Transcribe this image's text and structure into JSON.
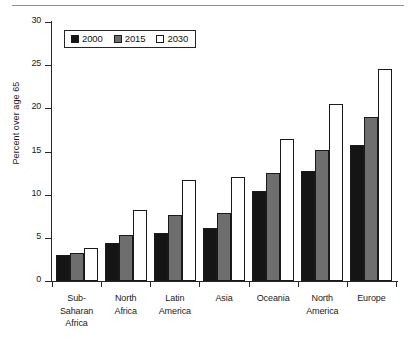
{
  "figure": {
    "top_rule": true
  },
  "chart_data": {
    "type": "bar",
    "title": "",
    "xlabel": "",
    "ylabel": "Percent over age 65",
    "ylim": [
      0,
      30
    ],
    "ytick_labels": [
      "0",
      "5",
      "10",
      "15",
      "20",
      "25",
      "30"
    ],
    "yticks": [
      0,
      5,
      10,
      15,
      20,
      25,
      30
    ],
    "grid": false,
    "legend_position": "upper left",
    "categories": [
      "Sub-\nSaharan\nAfrica",
      "North\nAfrica",
      "Latin\nAmerica",
      "Asia",
      "Oceania",
      "North\nAmerica",
      "Europe"
    ],
    "category_labels": [
      [
        "Sub-",
        "Saharan",
        "Africa"
      ],
      [
        "North",
        "Africa"
      ],
      [
        "Latin",
        "America"
      ],
      [
        "Asia"
      ],
      [
        "Oceania"
      ],
      [
        "North",
        "America"
      ],
      [
        "Europe"
      ]
    ],
    "series": [
      {
        "name": "2000",
        "color": "#151515",
        "values": [
          3.0,
          4.4,
          5.6,
          6.1,
          10.4,
          12.7,
          15.7
        ]
      },
      {
        "name": "2015",
        "color": "#6e6e6e",
        "values": [
          3.2,
          5.3,
          7.6,
          7.9,
          12.5,
          15.2,
          19.0
        ]
      },
      {
        "name": "2030",
        "color": "#ffffff",
        "values": [
          3.8,
          8.2,
          11.7,
          12.1,
          16.5,
          20.5,
          24.6
        ]
      }
    ]
  },
  "legend": {
    "entries": [
      {
        "label": "2000",
        "swatch": "#151515"
      },
      {
        "label": "2015",
        "swatch": "#6e6e6e"
      },
      {
        "label": "2030",
        "swatch": "#ffffff"
      }
    ]
  }
}
